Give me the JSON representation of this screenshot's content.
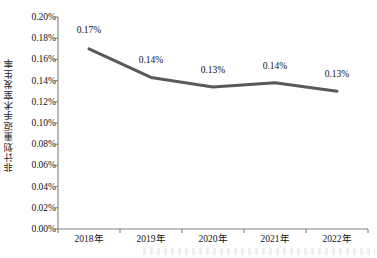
{
  "chart_data": {
    "type": "line",
    "title": "",
    "xlabel": "",
    "ylabel": "非计划重返手术室发生率",
    "categories": [
      "2018年",
      "2019年",
      "2020年",
      "2021年",
      "2022年"
    ],
    "values": [
      0.17,
      0.143,
      0.134,
      0.138,
      0.13
    ],
    "point_labels": [
      "0.17%",
      "0.14%",
      "0.13%",
      "0.14%",
      "0.13%"
    ],
    "ylim": [
      0,
      0.2
    ],
    "ytick_labels": [
      "0.20%",
      "0.18%",
      "0.16%",
      "0.14%",
      "0.12%",
      "0.10%",
      "0.08%",
      "0.06%",
      "0.04%",
      "0.02%",
      "0.00%"
    ],
    "ytick_values": [
      0.2,
      0.18,
      0.16,
      0.14,
      0.12,
      0.1,
      0.08,
      0.06,
      0.04,
      0.02,
      0.0
    ],
    "grid": false,
    "legend": null,
    "series_color": "#595959",
    "axis_color": "#7f7f7f",
    "line_width": 3
  }
}
